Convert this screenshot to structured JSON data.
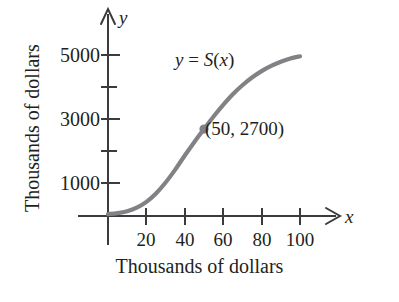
{
  "chart_data": {
    "type": "line",
    "title": "",
    "subtitle": "",
    "xlabel": "Thousands of dollars",
    "ylabel": "Thousands of dollars",
    "xlim": [
      0,
      110
    ],
    "ylim": [
      0,
      5600
    ],
    "grid": false,
    "legend_position": "none",
    "x_ticks": [
      20,
      40,
      60,
      80,
      100
    ],
    "x_tick_labels": [
      "20",
      "40",
      "60",
      "80",
      "100"
    ],
    "y_ticks": [
      1000,
      2000,
      3000,
      4000,
      5000
    ],
    "y_tick_labels": [
      "1000",
      "",
      "3000",
      "",
      "5000"
    ],
    "y_labeled_ticks": [
      1000,
      3000,
      5000
    ],
    "y_minor_ticks": [
      2000,
      4000
    ],
    "axis_name_x": "x",
    "axis_name_y": "y",
    "series": [
      {
        "name": "y = S(x)",
        "label_text": "y = S(x)",
        "color": "#808285",
        "x": [
          0,
          5,
          10,
          15,
          20,
          25,
          30,
          35,
          40,
          45,
          50,
          55,
          60,
          65,
          70,
          75,
          80,
          85,
          90,
          95,
          100
        ],
        "y": [
          60,
          90,
          150,
          260,
          440,
          700,
          1040,
          1440,
          1880,
          2300,
          2700,
          3090,
          3450,
          3780,
          4060,
          4300,
          4500,
          4660,
          4790,
          4890,
          4960
        ]
      }
    ],
    "annotations": [
      {
        "text": "(50, 2700)",
        "x": 50,
        "y": 2700,
        "marker": true,
        "marker_color": "#7f8184"
      },
      {
        "text": "y = S(x)",
        "x": 34,
        "y": 4450,
        "marker": false
      }
    ]
  },
  "labels": {
    "y_axis_caption": "Thousands of dollars",
    "x_axis_caption": "Thousands of dollars",
    "axis_x_symbol": "x",
    "axis_y_symbol": "y",
    "function_label_lhs": "y",
    "function_label_eq": "=",
    "function_label_rhs": "S",
    "function_label_arg_open": "(",
    "function_label_arg": "x",
    "function_label_arg_close": ")",
    "point_annotation": "(50, 2700)",
    "ytick_5000": "5000",
    "ytick_3000": "3000",
    "ytick_1000": "1000",
    "xtick_20": "20",
    "xtick_40": "40",
    "xtick_60": "60",
    "xtick_80": "80",
    "xtick_100": "100"
  },
  "colors": {
    "curve": "#808285",
    "axis": "#3b3b3d",
    "marker": "#7f8184",
    "text": "#231f20",
    "background": "#ffffff"
  }
}
